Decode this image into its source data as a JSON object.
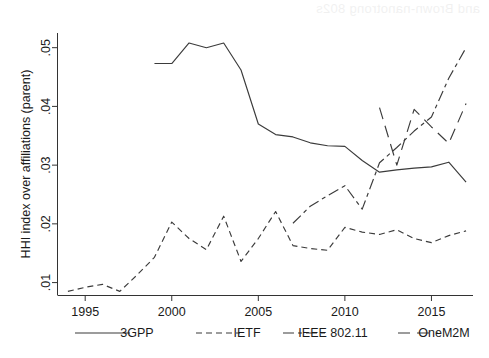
{
  "figure": {
    "background_color": "#ffffff",
    "line_color": "#3b3b3b",
    "axis_color": "#333333"
  },
  "artifact": {
    "bleed_text": "and Brown-nanotrong 802s"
  },
  "chart_data": {
    "type": "line",
    "title": "",
    "xlabel": "",
    "ylabel": "HHI index over affiliations (parent)",
    "xlim": [
      1993.4,
      2017.4
    ],
    "ylim": [
      0.0078,
      0.0525
    ],
    "grid": false,
    "legend_position": "bottom",
    "xticks": [
      1995,
      2000,
      2005,
      2010,
      2015
    ],
    "xtick_labels": [
      "1995",
      "2000",
      "2005",
      "2010",
      "2015"
    ],
    "yticks": [
      0.01,
      0.02,
      0.03,
      0.04,
      0.05
    ],
    "ytick_labels": [
      ".01",
      ".02",
      ".03",
      ".04",
      ".05"
    ],
    "series": [
      {
        "name": "3GPP",
        "dash": "solid",
        "dasharray": "none",
        "x": [
          1999,
          2000,
          2001,
          2002,
          2003,
          2004,
          2005,
          2006,
          2007,
          2008,
          2009,
          2010,
          2011,
          2012,
          2013,
          2014,
          2015,
          2016,
          2017
        ],
        "values": [
          0.0473,
          0.0473,
          0.0508,
          0.05,
          0.0508,
          0.0462,
          0.037,
          0.0352,
          0.0348,
          0.0338,
          0.0333,
          0.0332,
          0.0308,
          0.0288,
          0.0292,
          0.0295,
          0.0297,
          0.0305,
          0.0271
        ]
      },
      {
        "name": "IETF",
        "dash": "dashed",
        "dasharray": "6,4",
        "x": [
          1994,
          1995,
          1996,
          1997,
          1998,
          1999,
          2000,
          2001,
          2002,
          2003,
          2004,
          2005,
          2006,
          2007,
          2008,
          2009,
          2010,
          2011,
          2012,
          2013,
          2014,
          2015,
          2016,
          2017
        ],
        "values": [
          0.0085,
          0.0092,
          0.0097,
          0.0085,
          0.0113,
          0.0143,
          0.0203,
          0.0175,
          0.0156,
          0.0213,
          0.0136,
          0.0175,
          0.0221,
          0.0163,
          0.0158,
          0.0155,
          0.0194,
          0.0186,
          0.0182,
          0.019,
          0.0175,
          0.0168,
          0.018,
          0.0188
        ]
      },
      {
        "name": "IEEE 802.11",
        "dash": "longdash-dot",
        "dasharray": "11,4,4,4",
        "x": [
          2007,
          2008,
          2009,
          2010,
          2011,
          2012,
          2013,
          2014,
          2015,
          2016,
          2017
        ],
        "values": [
          0.0201,
          0.023,
          0.0248,
          0.0265,
          0.0225,
          0.0304,
          0.033,
          0.0358,
          0.0382,
          0.0448,
          0.05
        ]
      },
      {
        "name": "OneM2M",
        "dash": "longdash",
        "dasharray": "12,7",
        "x": [
          2012,
          2013,
          2014,
          2015,
          2016,
          2017
        ],
        "values": [
          0.0398,
          0.03,
          0.0395,
          0.0365,
          0.0337,
          0.0405
        ]
      }
    ]
  },
  "legend": {
    "items": [
      {
        "label": "3GPP",
        "dasharray": "none"
      },
      {
        "label": "IETF",
        "dasharray": "6,4"
      },
      {
        "label": "IEEE 802.11",
        "dasharray": "11,4,4,4"
      },
      {
        "label": "OneM2M",
        "dasharray": "12,7"
      }
    ]
  }
}
